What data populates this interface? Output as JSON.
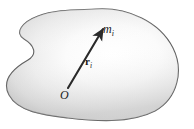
{
  "figure": {
    "kind": "physics-diagram",
    "background_color": "#ffffff",
    "body": {
      "name": "rigid-body-blob",
      "outline_color": "#5a5a5a",
      "fill_light": "#ffffff",
      "fill_mid": "#ececec",
      "fill_shadow": "#c9c9c9"
    },
    "vector": {
      "name": "position-vector",
      "color": "#2a2a2a",
      "from": {
        "x": 68,
        "y": 88
      },
      "to": {
        "x": 104,
        "y": 28
      }
    },
    "labels": {
      "mass": {
        "base": "m",
        "subscript": "i"
      },
      "vector": {
        "base": "r",
        "subscript": "i"
      },
      "origin": {
        "base": "O",
        "subscript": ""
      }
    }
  }
}
